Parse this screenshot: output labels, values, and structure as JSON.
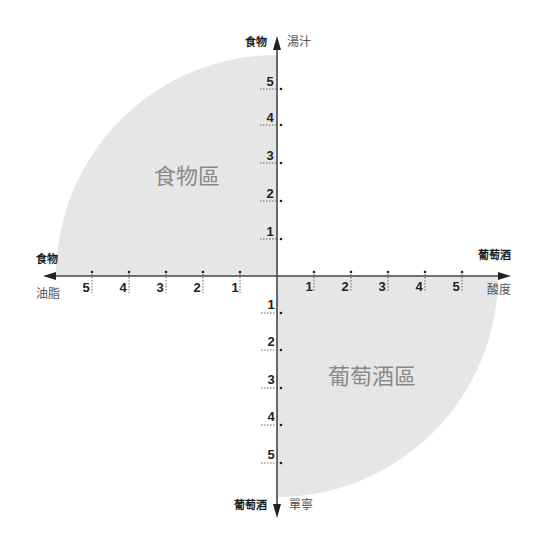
{
  "diagram": {
    "center": {
      "x": 277,
      "y": 276
    },
    "radius": 221,
    "fill_color": "#e6e6e6",
    "axis_color": "#444444",
    "zone_text_color": "#8a8a8a",
    "axes": {
      "top": {
        "bold_label": "食物",
        "light_label": "湯汁"
      },
      "left": {
        "bold_label": "食物",
        "light_label": "油脂"
      },
      "right": {
        "bold_label": "葡萄酒",
        "light_label": "酸度"
      },
      "bottom": {
        "bold_label": "葡萄酒",
        "light_label": "單寧"
      }
    },
    "ticks": {
      "up": [
        "1",
        "2",
        "3",
        "4",
        "5"
      ],
      "left": [
        "1",
        "2",
        "3",
        "4",
        "5"
      ],
      "right": [
        "1",
        "2",
        "3",
        "4",
        "5"
      ],
      "down": [
        "1",
        "2",
        "3",
        "4",
        "5"
      ]
    },
    "zones": [
      {
        "quadrant": "top-left",
        "label": "食物區"
      },
      {
        "quadrant": "bottom-right",
        "label": "葡萄酒區"
      }
    ]
  }
}
